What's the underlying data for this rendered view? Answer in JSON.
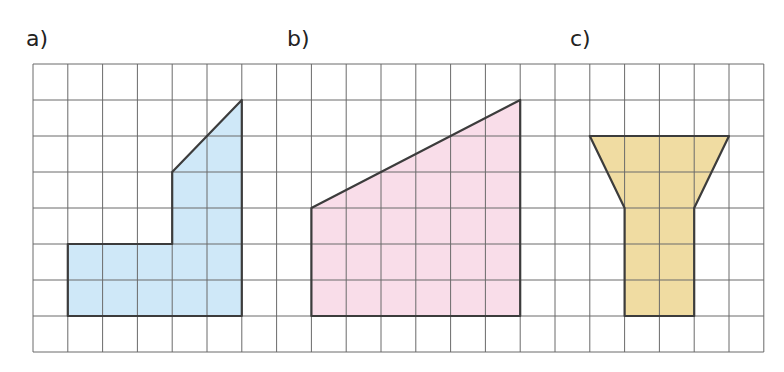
{
  "labels": {
    "a": "a)",
    "b": "b)",
    "c": "c)"
  },
  "grid": {
    "origin_x": 33,
    "origin_y": 64,
    "cell_w": 34.8,
    "cell_h": 36,
    "cols": 21,
    "rows": 8,
    "line_color": "#6a6a6a"
  },
  "shapes": [
    {
      "id": "a",
      "fill": "#cfe8f8",
      "points": [
        [
          1,
          5
        ],
        [
          4,
          5
        ],
        [
          4,
          3
        ],
        [
          6,
          1
        ],
        [
          6,
          7
        ],
        [
          1,
          7
        ]
      ]
    },
    {
      "id": "b",
      "fill": "#f9dde9",
      "points": [
        [
          8,
          4
        ],
        [
          14,
          1
        ],
        [
          14,
          7
        ],
        [
          8,
          7
        ]
      ]
    },
    {
      "id": "c",
      "fill": "#f0dca2",
      "points": [
        [
          16,
          2
        ],
        [
          20,
          2
        ],
        [
          19,
          4
        ],
        [
          19,
          7
        ],
        [
          17,
          7
        ],
        [
          17,
          4
        ]
      ]
    }
  ],
  "outline_color": "#3c3c3c"
}
